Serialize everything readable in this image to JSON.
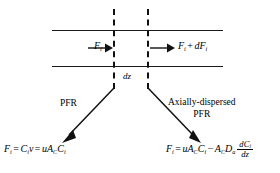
{
  "diagram": {
    "colors": {
      "line": "#1a1a1a",
      "dashed": "#111111",
      "text": "#000000",
      "background": "#ffffff"
    },
    "channel": {
      "inlet_flow_label": "F_i",
      "outlet_flow_label": "F_i + dF_i",
      "thickness_label": "dz"
    },
    "branches": [
      {
        "id": "pfr",
        "label": "PFR"
      },
      {
        "id": "axially-dispersed-pfr",
        "label_line1": "Axially-dispersed",
        "label_line2": "PFR"
      }
    ],
    "equations": {
      "pfr": "F_i = C_i v = uA_C C_i",
      "axially_dispersed_pfr": "F_i = uA_C C_i - A_C D_a dC_i/dz"
    },
    "symbols": {
      "F": "F",
      "C": "C",
      "u": "u",
      "v": "v",
      "A": "A",
      "D": "D",
      "d": "d",
      "z": "z",
      "sub_i": "i",
      "sub_C": "C",
      "sub_a": "a",
      "equals": "=",
      "plus": "+",
      "minus": "−"
    }
  }
}
